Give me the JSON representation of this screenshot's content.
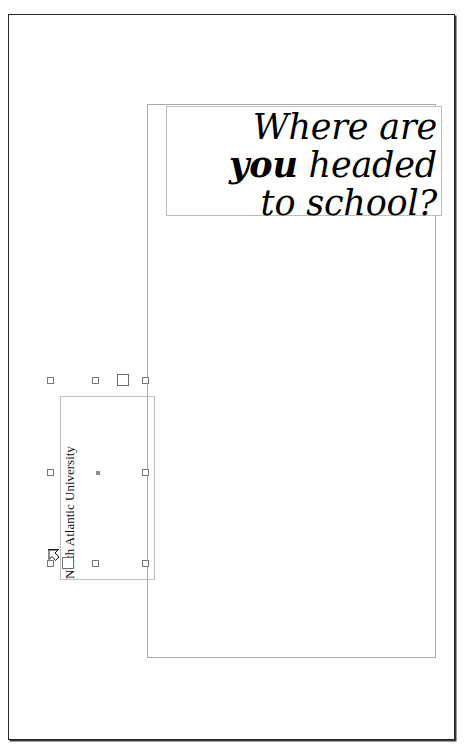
{
  "document": {
    "page_background": "#ffffff",
    "page_border_color": "#262626"
  },
  "content_frame": {
    "name": "main-layout-frame",
    "border_color": "#a9a9a9"
  },
  "headline": {
    "line1": "Where are",
    "line2_bold": "you",
    "line2_rest": " headed",
    "line3": "to school?",
    "full_text": "Where are you headed to school?",
    "align": "right",
    "style": "italic serif",
    "color": "#000000",
    "box_border_color": "#bdbdbd"
  },
  "vertical_textbox": {
    "text": "North Atlantic University",
    "rotation_degrees": -90,
    "reading_direction": "bottom-to-top",
    "selected": true,
    "border_color": "#bfbfbf",
    "color": "#111111"
  },
  "selection": {
    "handle_fill": "#ffffff",
    "handle_border": "#7a7a7a",
    "center_marker_color": "#8c8c8c",
    "handles": [
      {
        "name": "handle-top-left",
        "x": 47,
        "y": 377,
        "size": "small"
      },
      {
        "name": "handle-top-center",
        "x": 92,
        "y": 377,
        "size": "small"
      },
      {
        "name": "handle-top-rotate",
        "x": 117,
        "y": 375,
        "size": "large"
      },
      {
        "name": "handle-top-right",
        "x": 142,
        "y": 377,
        "size": "small"
      },
      {
        "name": "handle-middle-left",
        "x": 47,
        "y": 469,
        "size": "small"
      },
      {
        "name": "handle-middle-right",
        "x": 142,
        "y": 469,
        "size": "small"
      },
      {
        "name": "handle-bottom-left",
        "x": 47,
        "y": 560,
        "size": "small"
      },
      {
        "name": "handle-bottom-grip",
        "x": 62,
        "y": 558,
        "size": "large"
      },
      {
        "name": "handle-bottom-center",
        "x": 92,
        "y": 560,
        "size": "small"
      },
      {
        "name": "handle-bottom-right",
        "x": 142,
        "y": 560,
        "size": "small"
      }
    ],
    "center_marker": {
      "x": 96,
      "y": 471
    }
  },
  "cursor": {
    "name": "resize-cursor",
    "x": 48,
    "y": 549,
    "type": "diagonal-resize"
  }
}
